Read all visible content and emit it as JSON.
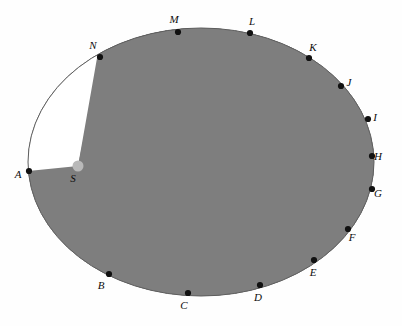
{
  "figure": {
    "background_color": "#fefefe",
    "shaded_color": "#7e7e7e",
    "plain_color": "#ffffff",
    "outline_color": "#5d5d5d",
    "dot_color": "#111111",
    "label_color": "#0d0d0d",
    "center_label": "S",
    "center_point": {
      "x": 78,
      "y": 166
    }
  },
  "ellipse": {
    "cx": 201,
    "cy": 162,
    "rx": 173,
    "ry": 134
  },
  "chart_data": {
    "type": "pie",
    "xlabel": "",
    "ylabel": "",
    "center_vertex": "S",
    "sector_count": 14,
    "shading_sequence": [
      "plain",
      "shaded",
      "plain",
      "shaded",
      "plain",
      "shaded",
      "plain",
      "shaded",
      "plain",
      "shaded",
      "plain",
      "shaded",
      "plain",
      "shaded"
    ],
    "categories": [
      "A-B",
      "B-C",
      "C-D",
      "D-E",
      "E-F",
      "F-G",
      "G-H",
      "H-I",
      "I-J",
      "J-K",
      "K-L",
      "L-M",
      "M-N",
      "N-A"
    ],
    "values": [
      1,
      1,
      1,
      1,
      1,
      1,
      1,
      1,
      1,
      1,
      1,
      1,
      1,
      1
    ],
    "vertices": [
      {
        "label": "A",
        "x": 29,
        "y": 171,
        "label_x": 18,
        "label_y": 175
      },
      {
        "label": "B",
        "x": 109,
        "y": 274,
        "label_x": 101,
        "label_y": 286
      },
      {
        "label": "C",
        "x": 188,
        "y": 293,
        "label_x": 184,
        "label_y": 306
      },
      {
        "label": "D",
        "x": 260,
        "y": 285,
        "label_x": 258,
        "label_y": 298
      },
      {
        "label": "E",
        "x": 314,
        "y": 260,
        "label_x": 313,
        "label_y": 273
      },
      {
        "label": "F",
        "x": 348,
        "y": 229,
        "label_x": 352,
        "label_y": 238
      },
      {
        "label": "G",
        "x": 372,
        "y": 189,
        "label_x": 378,
        "label_y": 194
      },
      {
        "label": "H",
        "x": 372,
        "y": 156,
        "label_x": 378,
        "label_y": 157
      },
      {
        "label": "I",
        "x": 368,
        "y": 119,
        "label_x": 375,
        "label_y": 118
      },
      {
        "label": "J",
        "x": 341,
        "y": 86,
        "label_x": 349,
        "label_y": 83
      },
      {
        "label": "K",
        "x": 309,
        "y": 58,
        "label_x": 313,
        "label_y": 48
      },
      {
        "label": "L",
        "x": 250,
        "y": 33,
        "label_x": 252,
        "label_y": 22
      },
      {
        "label": "M",
        "x": 178,
        "y": 32,
        "label_x": 174,
        "label_y": 20
      },
      {
        "label": "N",
        "x": 100,
        "y": 57,
        "label_x": 93,
        "label_y": 46
      }
    ]
  }
}
